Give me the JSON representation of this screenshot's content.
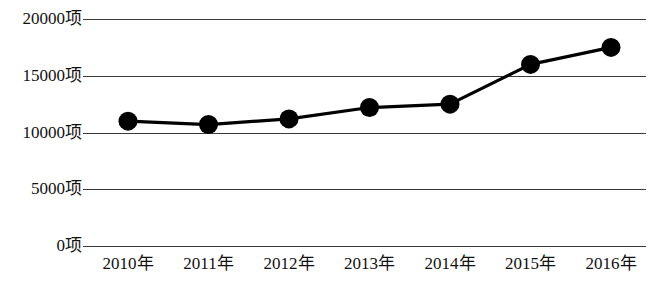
{
  "chart_data": {
    "type": "line",
    "title": "",
    "subtitle": "",
    "xlabel": "",
    "ylabel": "",
    "categories": [
      "2010年",
      "2011年",
      "2012年",
      "2013年",
      "2014年",
      "2015年",
      "2016年"
    ],
    "values": [
      11000,
      10700,
      11200,
      12200,
      12500,
      16000,
      17500
    ],
    "series": [
      {
        "name": "",
        "values": [
          11000,
          10700,
          11200,
          12200,
          12500,
          16000,
          17500
        ]
      }
    ],
    "ylim": [
      0,
      20000
    ],
    "y_ticks": [
      0,
      5000,
      10000,
      15000,
      20000
    ],
    "y_tick_labels": [
      "0项",
      "5000项",
      "10000项",
      "15000项",
      "20000项"
    ],
    "unit_suffix": "项",
    "grid": true,
    "grid_axis": "y",
    "legend": false,
    "legend_position": "none",
    "marker": "circle",
    "marker_color": "#000000",
    "line_color": "#000000",
    "background_color": "#ffffff",
    "annotations": []
  }
}
